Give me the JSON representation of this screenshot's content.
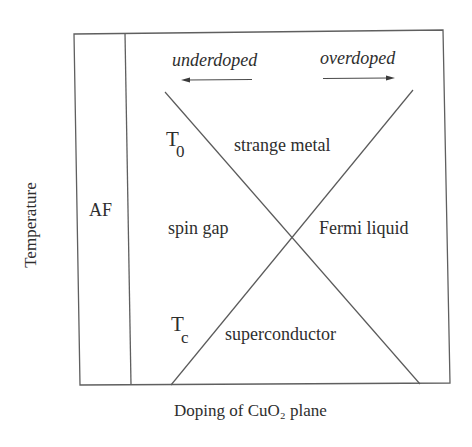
{
  "diagram": {
    "axes": {
      "x_label": "Doping of CuO₂ plane",
      "y_label": "Temperature"
    },
    "direction_labels": {
      "left": "underdoped",
      "right": "overdoped"
    },
    "regions": {
      "af": "AF",
      "strange_metal": "strange metal",
      "spin_gap": "spin gap",
      "fermi_liquid": "Fermi liquid",
      "superconductor": "superconductor"
    },
    "crossover_lines": {
      "t0": {
        "main": "T",
        "sub": "0"
      },
      "tc": {
        "main": "T",
        "sub": "c"
      }
    },
    "colors": {
      "line": "#5a5a5a",
      "text": "#2e2e2e",
      "background": "#ffffff"
    }
  }
}
